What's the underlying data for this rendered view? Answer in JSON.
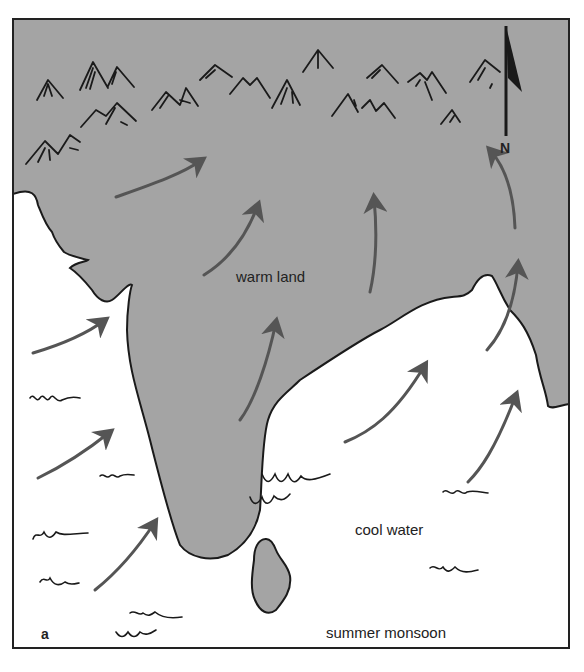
{
  "figure": {
    "panel_label": "a",
    "caption": "summer monsoon",
    "labels": {
      "land": "warm land",
      "water": "cool water",
      "north": "N"
    },
    "colors": {
      "land": "#a4a4a4",
      "water": "#ffffff",
      "ink": "#1a1a1a",
      "wind_arrow": "#555555",
      "frame": "#222222"
    },
    "icons": {
      "north_arrow": "north-arrow-icon",
      "mountains": "mountain-icon",
      "waves": "wave-icon",
      "wind": "wind-arrow-icon"
    },
    "wind_direction": "from sea (southwest) toward land (northeast)"
  }
}
